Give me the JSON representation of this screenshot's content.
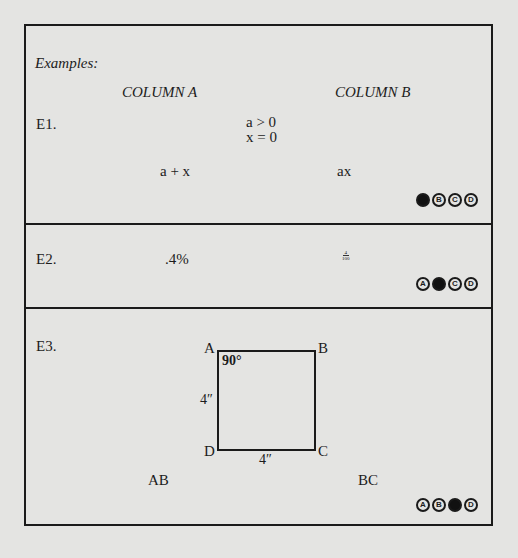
{
  "examples_label": "Examples:",
  "columns": {
    "a": "COLUMN A",
    "b": "COLUMN B"
  },
  "questions": [
    {
      "number": "E1.",
      "centered_info": [
        "a > 0",
        "x = 0"
      ],
      "column_a": "a + x",
      "column_b": "ax",
      "answer_choices": [
        "A",
        "B",
        "C",
        "D"
      ],
      "selected_answer": "A"
    },
    {
      "number": "E2.",
      "column_a": ".4%",
      "column_b": {
        "numerator": "4",
        "denominator": "100"
      },
      "answer_choices": [
        "A",
        "B",
        "C",
        "D"
      ],
      "selected_answer": "B"
    },
    {
      "number": "E3.",
      "figure": {
        "vertices": [
          "A",
          "B",
          "C",
          "D"
        ],
        "angle_label": "90°",
        "side_left_label": "4″",
        "side_bottom_label": "4″"
      },
      "column_a": "AB",
      "column_b": "BC",
      "answer_choices": [
        "A",
        "B",
        "C",
        "D"
      ],
      "selected_answer": "C"
    }
  ]
}
